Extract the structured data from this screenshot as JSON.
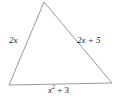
{
  "figure": {
    "name": "triangle-with-algebraic-side-lengths",
    "shape": "triangle",
    "stroke_color": "#8c8c8c",
    "background_color": "#ffffff",
    "vertices": {
      "apex": [
        44,
        2
      ],
      "bottom_left": [
        9,
        85
      ],
      "bottom_right": [
        112,
        83
      ]
    },
    "labels": {
      "left_side": {
        "text": "2x",
        "coefficient": "2",
        "variable": "x"
      },
      "right_side": {
        "text": "2x + 5",
        "coefficient": "2",
        "variable": "x",
        "operator": " + ",
        "constant": "5"
      },
      "bottom_side": {
        "text": "x2 + 3",
        "variable": "x",
        "exponent": "2",
        "operator": " + ",
        "constant": "3"
      }
    }
  }
}
